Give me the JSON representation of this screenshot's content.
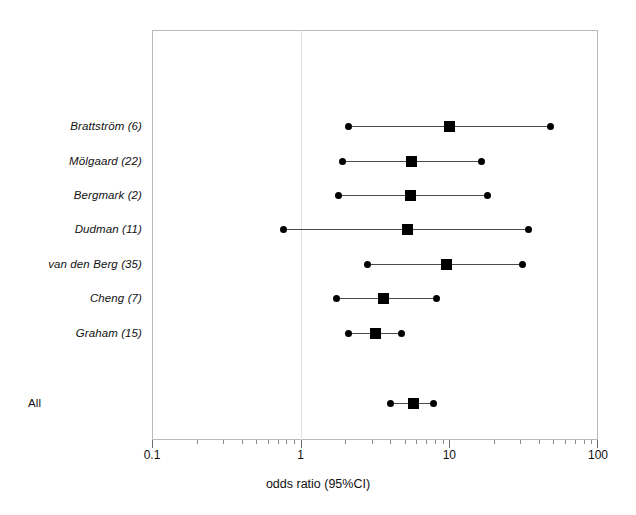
{
  "chart_data": {
    "type": "scatter",
    "subtype": "forest-plot",
    "title": "",
    "xlabel": "odds ratio (95%CI)",
    "ylabel": "",
    "xscale": "log",
    "xlim": [
      0.1,
      100
    ],
    "xticks": [
      0.1,
      1,
      10,
      100
    ],
    "xtick_labels": [
      "0.1",
      "1",
      "10",
      "100"
    ],
    "reference_line": 1,
    "grid": false,
    "legend": null,
    "categories": [
      "Brattström (6)",
      "Mölgaard (22)",
      "Bergmark (2)",
      "Dudman (11)",
      "van den Berg (35)",
      "Cheng (7)",
      "Graham (15)",
      "All"
    ],
    "rows": [
      {
        "label": "Brattström (6)",
        "n": 6,
        "odds_ratio": 10.1,
        "ci_low": 2.1,
        "ci_high": 48.0,
        "summary": false
      },
      {
        "label": "Mölgaard (22)",
        "n": 22,
        "odds_ratio": 5.6,
        "ci_low": 1.9,
        "ci_high": 16.5,
        "summary": false
      },
      {
        "label": "Bergmark (2)",
        "n": 2,
        "odds_ratio": 5.5,
        "ci_low": 1.8,
        "ci_high": 18.0,
        "summary": false
      },
      {
        "label": "Dudman (11)",
        "n": 11,
        "odds_ratio": 5.2,
        "ci_low": 0.77,
        "ci_high": 34.0,
        "summary": false
      },
      {
        "label": "van den Berg (35)",
        "n": 35,
        "odds_ratio": 9.5,
        "ci_low": 2.8,
        "ci_high": 31.0,
        "summary": false
      },
      {
        "label": "Cheng (7)",
        "n": 7,
        "odds_ratio": 3.6,
        "ci_low": 1.75,
        "ci_high": 8.2,
        "summary": false
      },
      {
        "label": "Graham (15)",
        "n": 15,
        "odds_ratio": 3.2,
        "ci_low": 2.1,
        "ci_high": 4.8,
        "summary": false
      },
      {
        "label": "All",
        "n": null,
        "odds_ratio": 5.7,
        "ci_low": 4.0,
        "ci_high": 7.8,
        "summary": true
      }
    ],
    "colors": {
      "marker": "#000000",
      "ci_line": "#4a4a4a",
      "frame": "#b9b9b9",
      "reference_line": "#e2e2e2",
      "text": "#111111"
    }
  }
}
